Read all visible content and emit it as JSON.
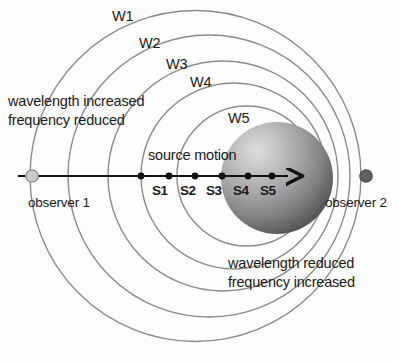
{
  "diagram": {
    "background_color": "#fdfdfd",
    "wavefront_labels": [
      {
        "id": "W1",
        "text": "W1",
        "x": 112,
        "y": 8
      },
      {
        "id": "W2",
        "text": "W2",
        "x": 139,
        "y": 35
      },
      {
        "id": "W3",
        "text": "W3",
        "x": 166,
        "y": 56
      },
      {
        "id": "W4",
        "text": "W4",
        "x": 190,
        "y": 74
      },
      {
        "id": "W5",
        "text": "W5",
        "x": 228,
        "y": 110
      }
    ],
    "source_labels": [
      {
        "id": "S1",
        "text": "S1",
        "x": 152,
        "y": 183
      },
      {
        "id": "S2",
        "text": "S2",
        "x": 180,
        "y": 183
      },
      {
        "id": "S3",
        "text": "S3",
        "x": 206,
        "y": 183
      },
      {
        "id": "S4",
        "text": "S4",
        "x": 233,
        "y": 183
      },
      {
        "id": "S5",
        "text": "S5",
        "x": 260,
        "y": 183
      }
    ],
    "source_motion_label": {
      "text": "source motion",
      "x": 148,
      "y": 147
    },
    "observer_left": {
      "label": "observer 1",
      "label_x": 28,
      "label_y": 195,
      "marker_color": "#c8c8c8",
      "marker_stroke": "#8f8f8f",
      "marker_cx": 32,
      "marker_cy": 176,
      "marker_r": 6
    },
    "observer_right": {
      "label": "observer 2",
      "label_x": 325,
      "label_y": 195,
      "marker_color": "#5f5f5f",
      "marker_stroke": "#4a4a4a",
      "marker_cx": 366,
      "marker_cy": 176,
      "marker_r": 6
    },
    "note_left": {
      "line1": "wavelength increased",
      "line2": "frequency reduced",
      "x": 8,
      "y": 92
    },
    "note_right": {
      "line1": "wavelength reduced",
      "line2": "frequency increased",
      "x": 228,
      "y": 254
    },
    "axis": {
      "y": 176,
      "x_start": 18,
      "x_end": 292,
      "color": "#111111",
      "stroke_width": 2.1,
      "arrow_label": "arrow-right"
    },
    "source_points": [
      {
        "id": "S1",
        "cx": 141,
        "cy": 176,
        "r": 3.4
      },
      {
        "id": "S2",
        "cx": 169,
        "cy": 176,
        "r": 3.4
      },
      {
        "id": "S3",
        "cx": 195,
        "cy": 176,
        "r": 3.4
      },
      {
        "id": "S4",
        "cx": 222,
        "cy": 176,
        "r": 3.4
      },
      {
        "id": "S5",
        "cx": 248,
        "cy": 176,
        "r": 3.4
      },
      {
        "id": "S6",
        "cx": 272,
        "cy": 176,
        "r": 3.4
      }
    ],
    "sphere": {
      "cx": 277,
      "cy": 178,
      "r": 56,
      "highlight_color": "#d8d8d8",
      "mid_color": "#9a9a9a",
      "edge_color": "#5a5a5a"
    },
    "wavefront_circles": [
      {
        "id": "W1",
        "cx": 195.5,
        "cy": 176,
        "r": 165.5
      },
      {
        "id": "W2",
        "cx": 209.0,
        "cy": 176,
        "r": 141.0
      },
      {
        "id": "W3",
        "cx": 223.0,
        "cy": 176,
        "r": 115.0
      },
      {
        "id": "W4",
        "cx": 234.0,
        "cy": 176,
        "r": 93.0
      },
      {
        "id": "W5",
        "cx": 247.0,
        "cy": 176,
        "r": 70.0
      }
    ],
    "circle_stroke_color": "#8b8b8b",
    "circle_stroke_width": 1.4,
    "text_color": "#1a1a1a"
  }
}
